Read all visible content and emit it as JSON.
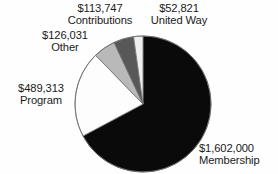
{
  "chart_data": {
    "type": "pie",
    "title": "",
    "subtitle": "",
    "xlabel": "",
    "ylabel": "",
    "legend_position": "none",
    "grid": false,
    "total": 2383912,
    "start_angle_deg": 0,
    "direction": "clockwise",
    "categories": [
      "Membership",
      "Program",
      "Other",
      "Contributions",
      "United Way"
    ],
    "values": [
      1602000,
      489313,
      126031,
      113747,
      52821
    ],
    "labels": [
      "$1,602,000",
      "$489,313",
      "$126,031",
      "$113,747",
      "$52,821"
    ],
    "colors": [
      "#0a0a0a",
      "#fdfdfd",
      "#b9b9b9",
      "#585858",
      "#efefef"
    ],
    "slices": [
      {
        "name": "Membership",
        "value": 1602000,
        "value_label": "$1,602,000",
        "category_label": "Membership",
        "percent": 67.2,
        "angle_deg": 241.9,
        "color": "#0a0a0a"
      },
      {
        "name": "Program",
        "value": 489313,
        "value_label": "$489,313",
        "category_label": "Program",
        "percent": 20.5,
        "angle_deg": 73.9,
        "color": "#fdfdfd"
      },
      {
        "name": "Other",
        "value": 126031,
        "value_label": "$126,031",
        "category_label": "Other",
        "percent": 5.3,
        "angle_deg": 19.0,
        "color": "#b9b9b9"
      },
      {
        "name": "Contributions",
        "value": 113747,
        "value_label": "$113,747",
        "category_label": "Contributions",
        "percent": 4.8,
        "angle_deg": 17.2,
        "color": "#585858"
      },
      {
        "name": "United Way",
        "value": 52821,
        "value_label": "$52,821",
        "category_label": "United Way",
        "percent": 2.2,
        "angle_deg": 8.0,
        "color": "#efefef"
      }
    ]
  },
  "labels": {
    "membership": {
      "value": "$1,602,000",
      "category": "Membership"
    },
    "program": {
      "value": "$489,313",
      "category": "Program"
    },
    "other": {
      "value": "$126,031",
      "category": "Other"
    },
    "contributions": {
      "value": "$113,747",
      "category": "Contributions"
    },
    "united_way": {
      "value": "$52,821",
      "category": "United Way"
    }
  },
  "style": {
    "outline_color": "#6e6e6e",
    "text_color": "#1a1a1a",
    "background": "#fefefe"
  }
}
